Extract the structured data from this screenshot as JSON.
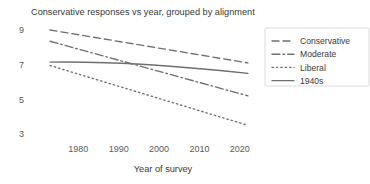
{
  "chart_data": {
    "type": "line",
    "title": "Conservative responses vs year, grouped by alignment",
    "xlabel": "Year of survey",
    "ylabel": "",
    "xlim": [
      1972,
      2024
    ],
    "ylim": [
      2.2,
      9.6
    ],
    "xticks": [
      1980,
      1990,
      2000,
      2010,
      2020
    ],
    "xticklabels": [
      "1980",
      "1990",
      "2000",
      "2010",
      "2020"
    ],
    "yticks": [
      3,
      5,
      7,
      9
    ],
    "yticklabels": [
      "3",
      "5",
      "7",
      "9"
    ],
    "grid": false,
    "legend_position": "upper right",
    "line_color": "#6f6f6f",
    "x": [
      1973,
      2022
    ],
    "series": [
      {
        "name": "Conservative",
        "style": "dashed",
        "values": [
          9.0,
          7.1
        ]
      },
      {
        "name": "Moderate",
        "style": "dashdot",
        "values": [
          8.35,
          5.2
        ]
      },
      {
        "name": "Liberal",
        "style": "dotted",
        "values": [
          6.95,
          3.5
        ]
      },
      {
        "name": "1940s",
        "style": "solid",
        "values": [
          7.15,
          6.5
        ]
      }
    ]
  },
  "legend": {
    "entries": [
      {
        "label": "Conservative"
      },
      {
        "label": "Moderate"
      },
      {
        "label": "Liberal"
      },
      {
        "label": "1940s"
      }
    ]
  }
}
